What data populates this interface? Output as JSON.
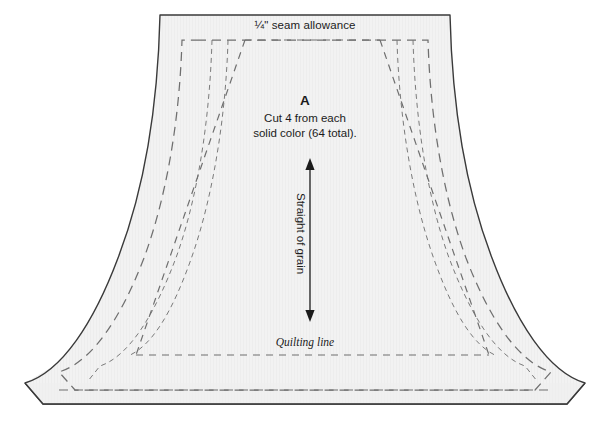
{
  "figure": {
    "kind": "quilt-pattern-template",
    "piece_letter": "A",
    "background_color": "#ffffff"
  },
  "labels": {
    "seam_allowance": "¼\" seam allowance",
    "piece_letter": "A",
    "instruction_line_1": "Cut 4 from each",
    "instruction_line_2": "solid color (64 total).",
    "grain": "Straight of grain",
    "quilting_line": "Quilting line"
  },
  "colors": {
    "piece_fill": "#f1f1f1",
    "piece_outline": "#3a3a3a",
    "dashed_line": "#6f6f6f",
    "text": "#1b1b1b",
    "arrow": "#1b1b1b"
  },
  "geometry": {
    "outline_points_note": "bell / lampshade silhouette with flat top, concave flaring sides, chamfered bottom corners",
    "top_edge": {
      "x1": 176,
      "x2": 450,
      "y": 15
    },
    "bottom_edge": {
      "x1": 43,
      "x2": 567,
      "y": 404
    },
    "chamfer_left": {
      "x": 25,
      "y": 383
    },
    "chamfer_right": {
      "x": 585,
      "y": 383
    },
    "seam_allowance_rect_top_y": 40,
    "quilting_line_y": 355,
    "grain_arrow": {
      "x": 310,
      "y_top": 160,
      "y_bottom": 320
    }
  },
  "dash_patterns": {
    "seam_allowance": "9,6",
    "inner_guide": "5,4",
    "quilting": "7,6"
  }
}
